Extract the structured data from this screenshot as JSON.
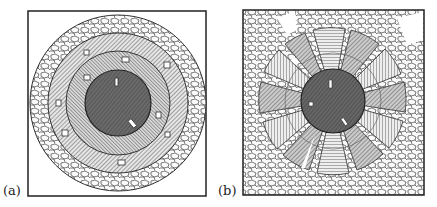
{
  "panels": [
    {
      "label": "(a)",
      "description": "Concentric layout: dark central core surrounded by hatched rings with small rectangles, outer pebble ring, inside square frame"
    },
    {
      "label": "(b)",
      "description": "Radial layout: dark central core with radial hatched wedge sectors separated by pebble-filled spokes, pebble fill outside, inside square frame"
    }
  ],
  "colors": {
    "ink": "#2a2a2a",
    "core": "#6e6e6e",
    "ring": "#a8a8a8",
    "light": "#f4f4f4"
  }
}
